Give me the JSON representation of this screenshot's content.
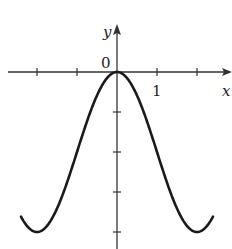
{
  "chart_data": {
    "type": "line",
    "title": "",
    "xlabel": "x",
    "ylabel": "y",
    "origin_label": "0",
    "x_tick_labels": [
      {
        "value": 1,
        "label": "1"
      }
    ],
    "x_ticks": [
      -2,
      -1,
      1,
      2
    ],
    "y_ticks": [
      -1,
      -2,
      -3,
      -4
    ],
    "xlim": [
      -2.75,
      2.85
    ],
    "ylim": [
      -4.4,
      1.1
    ],
    "grid": false,
    "legend": null,
    "series": [
      {
        "name": "curve",
        "function": "y = 2cos(pi*x/2) - 2",
        "x": [
          -2.4,
          -2.2,
          -2.0,
          -1.8,
          -1.6,
          -1.4,
          -1.2,
          -1.0,
          -0.8,
          -0.6,
          -0.4,
          -0.2,
          0.0,
          0.2,
          0.4,
          0.6,
          0.8,
          1.0,
          1.2,
          1.4,
          1.6,
          1.8,
          2.0,
          2.2,
          2.4
        ],
        "y": [
          -3.62,
          -3.9,
          -4.0,
          -3.9,
          -3.62,
          -3.18,
          -2.62,
          -2.0,
          -1.38,
          -0.82,
          -0.38,
          -0.1,
          0.0,
          -0.1,
          -0.38,
          -0.82,
          -1.38,
          -2.0,
          -2.62,
          -3.18,
          -3.62,
          -3.9,
          -4.0,
          -3.9,
          -3.62
        ]
      }
    ],
    "colors": {
      "axis": "#333333",
      "curve": "#1a1a1a",
      "background": "#ffffff"
    }
  }
}
